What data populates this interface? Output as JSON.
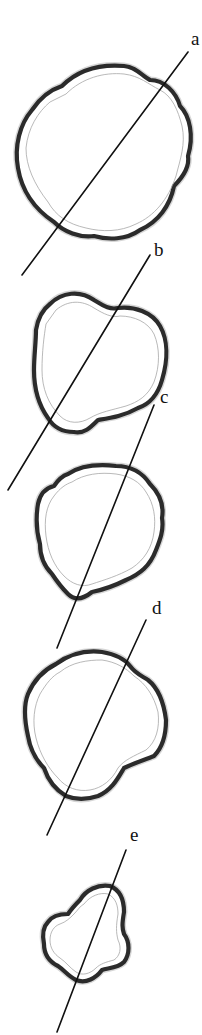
{
  "figure": {
    "colors": {
      "ink": "#111111",
      "outline": "#2b2b2b",
      "shading": "#8a8a8a",
      "background": "#ffffff"
    },
    "sections": [
      {
        "label": "a"
      },
      {
        "label": "b"
      },
      {
        "label": "c"
      },
      {
        "label": "d"
      },
      {
        "label": "e"
      }
    ]
  }
}
